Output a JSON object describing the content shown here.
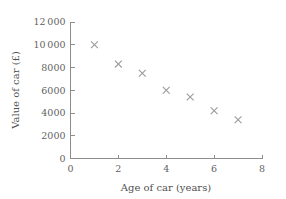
{
  "chart_data": {
    "type": "scatter",
    "title": "",
    "xlabel": "Age of car (years)",
    "ylabel": "Value of car (£)",
    "xlim": [
      0,
      8
    ],
    "ylim": [
      0,
      12000
    ],
    "grid": false,
    "legend": null,
    "marker": "x",
    "marker_color": "#9a9a9a",
    "axis_color": "#8d8d8d",
    "text_color": "#5f5f5f",
    "background": "#ffffff",
    "x": [
      1,
      2,
      3,
      4,
      5,
      6,
      7
    ],
    "values": [
      10000,
      8300,
      7500,
      6000,
      5400,
      4200,
      3400
    ],
    "points": [
      {
        "x": 1,
        "y": 10000
      },
      {
        "x": 2,
        "y": 8300
      },
      {
        "x": 3,
        "y": 7500
      },
      {
        "x": 4,
        "y": 6000
      },
      {
        "x": 5,
        "y": 5400
      },
      {
        "x": 6,
        "y": 4200
      },
      {
        "x": 7,
        "y": 3400
      }
    ],
    "xticks": [
      0,
      2,
      4,
      6,
      8
    ],
    "xtick_labels": [
      "0",
      "2",
      "4",
      "6",
      "8"
    ],
    "yticks": [
      0,
      2000,
      4000,
      6000,
      8000,
      10000,
      12000
    ],
    "ytick_labels": [
      "0",
      "2000",
      "4000",
      "6000",
      "8000",
      "10 000",
      "12 000"
    ]
  }
}
